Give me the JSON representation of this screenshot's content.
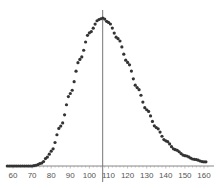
{
  "chart_data": {
    "type": "scatter",
    "title": "",
    "xlabel": "",
    "ylabel": "",
    "xlim": [
      57,
      163
    ],
    "x_ticks": [
      60,
      70,
      80,
      90,
      100,
      110,
      120,
      130,
      140,
      150,
      160
    ],
    "y_ticks": [],
    "grid": false,
    "legend": null,
    "vertical_marker_x": 108,
    "series": [
      {
        "name": "density",
        "marker": "dot",
        "color": "#333333",
        "shape": "right-skewed unimodal distribution",
        "x_start": 57,
        "x_end": 161,
        "x_step": 1,
        "onset_x": 72,
        "peak_x": 107,
        "peak_y_relative": 1.0,
        "points_relative": [
          [
            60,
            0.0
          ],
          [
            65,
            0.0
          ],
          [
            70,
            0.0
          ],
          [
            72,
            0.005
          ],
          [
            75,
            0.02
          ],
          [
            78,
            0.06
          ],
          [
            80,
            0.1
          ],
          [
            85,
            0.27
          ],
          [
            90,
            0.49
          ],
          [
            95,
            0.72
          ],
          [
            100,
            0.9
          ],
          [
            105,
            0.99
          ],
          [
            107,
            1.0
          ],
          [
            110,
            0.97
          ],
          [
            115,
            0.86
          ],
          [
            120,
            0.7
          ],
          [
            125,
            0.53
          ],
          [
            130,
            0.38
          ],
          [
            135,
            0.26
          ],
          [
            140,
            0.17
          ],
          [
            145,
            0.11
          ],
          [
            150,
            0.07
          ],
          [
            155,
            0.045
          ],
          [
            160,
            0.028
          ]
        ]
      }
    ]
  },
  "axis": {
    "tick_labels": [
      "60",
      "70",
      "80",
      "90",
      "100",
      "110",
      "120",
      "130",
      "140",
      "150",
      "160"
    ]
  }
}
